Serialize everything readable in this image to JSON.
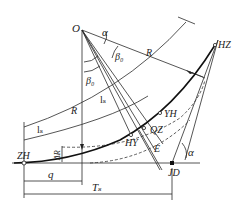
{
  "diagram": {
    "type": "transition-curve-geometry",
    "labels": {
      "center": "O",
      "deflection_angle_top": "α",
      "deflection_angle_bottom": "α",
      "spiral_angle_1": "β₀",
      "spiral_angle_2": "β₀",
      "radius_1": "R",
      "radius_2": "R",
      "spiral_length_1": "lₛ",
      "spiral_length_2": "lₛ",
      "zh": "ZH",
      "hy": "HY",
      "qz": "QZ",
      "yh": "YH",
      "hz": "HZ",
      "jd": "JD",
      "external": "E",
      "shift": "ΔR",
      "q": "q",
      "tangent": "Tₛ"
    },
    "colors": {
      "line": "#2a2a2a",
      "curve": "#111111",
      "background": "#ffffff"
    }
  }
}
